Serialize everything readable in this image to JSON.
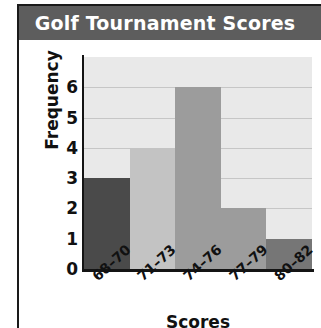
{
  "figure": {
    "title": "Golf Tournament Scores",
    "banner_color": "#5d5d5d",
    "title_color": "#ffffff",
    "frame_color": "#1a1a1a"
  },
  "chart_data": {
    "type": "bar",
    "title": "Golf Tournament Scores",
    "xlabel": "Scores",
    "ylabel": "Frequency",
    "categories": [
      "68–70",
      "71–73",
      "74–76",
      "77–79",
      "80–82"
    ],
    "values": [
      3,
      4,
      6,
      2,
      1
    ],
    "bar_colors": [
      "#4a4a4a",
      "#c3c3c3",
      "#9c9c9c",
      "#9c9c9c",
      "#767676"
    ],
    "ylim": [
      0,
      7
    ],
    "yticks": [
      0,
      1,
      2,
      3,
      4,
      5,
      6
    ],
    "ytick_labels": [
      "0",
      "1",
      "2",
      "3",
      "4",
      "5",
      "6"
    ],
    "grid": true,
    "gridline_color": "#c6c6c6",
    "plot_background": "#e9e9e9",
    "legend": null,
    "xtick_rotation": -42
  }
}
